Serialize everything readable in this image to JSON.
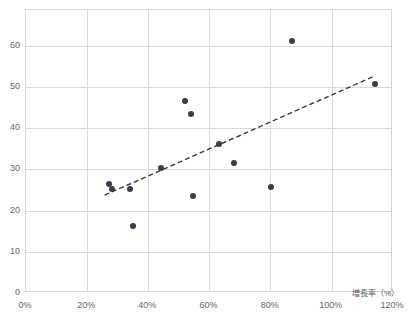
{
  "chart_data": {
    "type": "scatter",
    "title": "",
    "xlabel": "増長率（%）",
    "ylabel": "",
    "xlim": [
      0,
      120
    ],
    "ylim": [
      0,
      68.7
    ],
    "grid": true,
    "legend": false,
    "x_tick_labels": [
      "0%",
      "20%",
      "40%",
      "60%",
      "80%",
      "100%",
      "120%"
    ],
    "x_ticks": [
      0,
      20,
      40,
      60,
      80,
      100,
      120
    ],
    "y_tick_labels": [
      "0",
      "10",
      "20",
      "30",
      "40",
      "50",
      "60"
    ],
    "y_ticks": [
      0,
      10,
      20,
      30,
      40,
      50,
      60
    ],
    "marker_color": "#3b3b4f",
    "grid_color": "#d9d9d9",
    "points": [
      {
        "x": 27.0,
        "y": 26.5
      },
      {
        "x": 28.0,
        "y": 25.2
      },
      {
        "x": 34.0,
        "y": 25.3
      },
      {
        "x": 35.0,
        "y": 16.3
      },
      {
        "x": 44.0,
        "y": 30.4
      },
      {
        "x": 52.0,
        "y": 46.6
      },
      {
        "x": 54.0,
        "y": 43.4
      },
      {
        "x": 54.5,
        "y": 23.5
      },
      {
        "x": 63.0,
        "y": 36.2
      },
      {
        "x": 68.0,
        "y": 31.6
      },
      {
        "x": 80.0,
        "y": 25.7
      },
      {
        "x": 87.0,
        "y": 61.2
      },
      {
        "x": 114.0,
        "y": 50.7
      }
    ],
    "trendline": {
      "style": "dashed",
      "color": "#3b3b3b",
      "x_start": 26.0,
      "y_start": 23.5,
      "x_end": 114.5,
      "y_end": 52.5
    }
  },
  "axis": {
    "x_title": "増長率（%）"
  }
}
